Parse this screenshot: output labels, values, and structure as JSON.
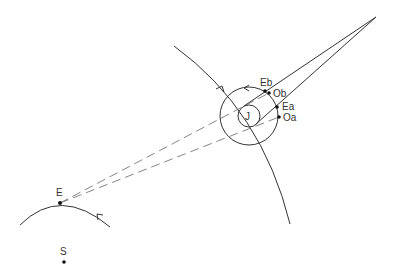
{
  "diagram": {
    "type": "astronomical-geometry",
    "colors": {
      "stroke": "#333333",
      "dashed": "#666666",
      "dot": "#111111",
      "background": "#ffffff"
    },
    "labels": {
      "jupiter": "J",
      "earth": "E",
      "sun": "S",
      "eclipse_begin": "Eb",
      "occultation_begin": "Ob",
      "eclipse_end": "Ea",
      "occultation_end": "Oa"
    },
    "points": {
      "jupiter": [
        249,
        116
      ],
      "earth": [
        60,
        203
      ],
      "sun": [
        64,
        262
      ],
      "eb": [
        265,
        91
      ],
      "ob": [
        269,
        93
      ],
      "ea": [
        277,
        107
      ],
      "oa": [
        279,
        117
      ],
      "shadow_apex": [
        376,
        17
      ]
    },
    "circles": {
      "jupiter_radius": 11,
      "moon_orbit_radius": 29
    }
  }
}
